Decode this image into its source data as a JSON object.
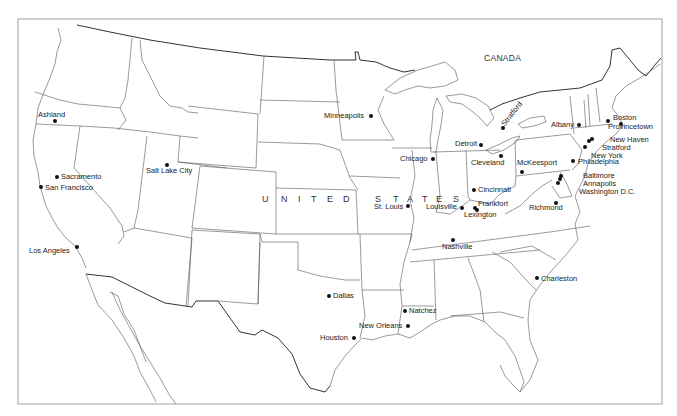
{
  "map": {
    "type": "outline political map",
    "country_label": "UNITED STATES",
    "country_label_letters": [
      "U",
      "N",
      "I",
      "T",
      "E",
      "D",
      "S",
      "T",
      "A",
      "T",
      "E",
      "S"
    ],
    "neighbor_labels": [
      {
        "name": "CANADA",
        "x": 483,
        "y": 56
      }
    ],
    "colors": {
      "background": "#ffffff",
      "borders": "#555555",
      "text": "#222222",
      "city_dot": "#111111"
    }
  },
  "cities": [
    {
      "name": "Ashland",
      "dot": [
        55,
        121
      ],
      "label": [
        38,
        111
      ],
      "anchor": "above"
    },
    {
      "name": "Minneapolis",
      "dot": [
        371,
        116
      ],
      "label": [
        324,
        112
      ],
      "anchor": "left"
    },
    {
      "name": "Stratford",
      "dot": [
        503,
        128
      ],
      "label": [
        506,
        112
      ],
      "anchor": "rotated"
    },
    {
      "name": "Detroit",
      "dot": [
        481,
        145
      ],
      "label": [
        455,
        140
      ],
      "anchor": "left"
    },
    {
      "name": "Chicago",
      "dot": [
        433,
        159
      ],
      "label": [
        400,
        155
      ],
      "anchor": "left"
    },
    {
      "name": "Cleveland",
      "dot": [
        501,
        156
      ],
      "label": [
        471,
        159
      ],
      "anchor": "below"
    },
    {
      "name": "McKeesport",
      "dot": [
        522,
        172
      ],
      "label": [
        517,
        159
      ],
      "anchor": "above"
    },
    {
      "name": "Sacramento",
      "dot": [
        57,
        177
      ],
      "label": [
        61,
        173
      ],
      "anchor": "right"
    },
    {
      "name": "San Francisco",
      "dot": [
        41,
        187
      ],
      "label": [
        45,
        184
      ],
      "anchor": "right"
    },
    {
      "name": "Salt Lake City",
      "dot": [
        167,
        165
      ],
      "label": [
        146,
        167
      ],
      "anchor": "below"
    },
    {
      "name": "Cincinnati",
      "dot": [
        474,
        190
      ],
      "label": [
        478,
        186
      ],
      "anchor": "right"
    },
    {
      "name": "St. Louis",
      "dot": [
        408,
        206
      ],
      "label": [
        374,
        203
      ],
      "anchor": "left"
    },
    {
      "name": "Louisville",
      "dot": [
        462,
        208
      ],
      "label": [
        426,
        203
      ],
      "anchor": "left"
    },
    {
      "name": "Frankfort",
      "dot": [
        475,
        208
      ],
      "label": [
        478,
        200
      ],
      "anchor": "right"
    },
    {
      "name": "Lexington",
      "dot": [
        477,
        210
      ],
      "label": [
        464,
        211
      ],
      "anchor": "below"
    },
    {
      "name": "Richmond",
      "dot": [
        556,
        203
      ],
      "label": [
        529,
        204
      ],
      "anchor": "below"
    },
    {
      "name": "Nashville",
      "dot": [
        453,
        240
      ],
      "label": [
        442,
        243
      ],
      "anchor": "below"
    },
    {
      "name": "Los Angeles",
      "dot": [
        77,
        247
      ],
      "label": [
        29,
        247
      ],
      "anchor": "left"
    },
    {
      "name": "Charleston",
      "dot": [
        537,
        278
      ],
      "label": [
        541,
        275
      ],
      "anchor": "right"
    },
    {
      "name": "Dallas",
      "dot": [
        329,
        296
      ],
      "label": [
        333,
        292
      ],
      "anchor": "right"
    },
    {
      "name": "Natchez",
      "dot": [
        405,
        311
      ],
      "label": [
        409,
        307
      ],
      "anchor": "right"
    },
    {
      "name": "New Orleans",
      "dot": [
        408,
        326
      ],
      "label": [
        359,
        322
      ],
      "anchor": "left"
    },
    {
      "name": "Houston",
      "dot": [
        354,
        338
      ],
      "label": [
        320,
        334
      ],
      "anchor": "left"
    },
    {
      "name": "Albany",
      "dot": [
        579,
        125
      ],
      "label": [
        551,
        121
      ],
      "anchor": "left"
    },
    {
      "name": "Boston",
      "dot": [
        608,
        121
      ],
      "label": [
        613,
        114
      ],
      "anchor": "right"
    },
    {
      "name": "Provincetown",
      "dot": [
        621,
        124
      ],
      "label": [
        608,
        123
      ],
      "anchor": "right"
    },
    {
      "name": "New Haven",
      "dot": [
        592,
        139
      ],
      "label": [
        610,
        136
      ],
      "anchor": "right"
    },
    {
      "name": "Stratford",
      "dot": [
        589,
        141
      ],
      "label": [
        602,
        144
      ],
      "anchor": "right"
    },
    {
      "name": "New York",
      "dot": [
        585,
        147
      ],
      "label": [
        591,
        152
      ],
      "anchor": "right"
    },
    {
      "name": "Philadelphia",
      "dot": [
        573,
        161
      ],
      "label": [
        578,
        158
      ],
      "anchor": "right"
    },
    {
      "name": "Baltimore",
      "dot": [
        561,
        176
      ],
      "label": [
        583,
        172
      ],
      "anchor": "right"
    },
    {
      "name": "Annapolis",
      "dot": [
        560,
        179
      ],
      "label": [
        583,
        180
      ],
      "anchor": "right"
    },
    {
      "name": "Washington D.C.",
      "dot": [
        558,
        183
      ],
      "label": [
        579,
        188
      ],
      "anchor": "right"
    }
  ]
}
